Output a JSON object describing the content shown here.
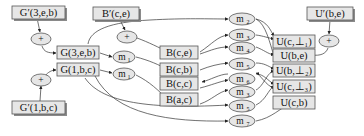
{
  "diagram": {
    "nodes": {
      "gprime_3eb": {
        "label": "G′(3,e,b)"
      },
      "gprime_1bc": {
        "label": "G′(1,b,c)"
      },
      "bprime_ce": {
        "label": "B′(c,e)"
      },
      "uprime_be": {
        "label": "U′(b,e)"
      },
      "g_3eb": {
        "label": "G(3,e,b)"
      },
      "g_1bc": {
        "label": "G(1,b,c)"
      },
      "b_ce": {
        "label": "B(c,e)"
      },
      "b_cb": {
        "label": "B(c,b)"
      },
      "b_cc": {
        "label": "B(c,c)"
      },
      "b_ac": {
        "label": "B(a,c)"
      },
      "u_c_bot1": {
        "label": "U(c,⊥₁)"
      },
      "u_be": {
        "label": "U(b,e)"
      },
      "u_b_bot2": {
        "label": "U(b,⊥₂)"
      },
      "u_c_bot3": {
        "label": "U(c,⊥₃)"
      },
      "u_cb": {
        "label": "U(c,b)"
      }
    },
    "operators": {
      "plus_g3": {
        "label": "+"
      },
      "plus_g1": {
        "label": "+"
      },
      "plus_b": {
        "label": "+"
      },
      "plus_u": {
        "label": "+"
      },
      "m1_a": {
        "label": "m",
        "sub": "1"
      },
      "m1_b": {
        "label": "m",
        "sub": "1"
      },
      "m2": {
        "label": "m",
        "sub": "2"
      },
      "m3_a": {
        "label": "m",
        "sub": "3"
      },
      "m4": {
        "label": "m",
        "sub": "4"
      },
      "m5_a": {
        "label": "m",
        "sub": "5"
      },
      "m6": {
        "label": "m",
        "sub": "6"
      },
      "m3_b": {
        "label": "m",
        "sub": "3"
      },
      "m5_b": {
        "label": "m",
        "sub": "5"
      },
      "m7": {
        "label": "m",
        "sub": "7"
      }
    }
  }
}
